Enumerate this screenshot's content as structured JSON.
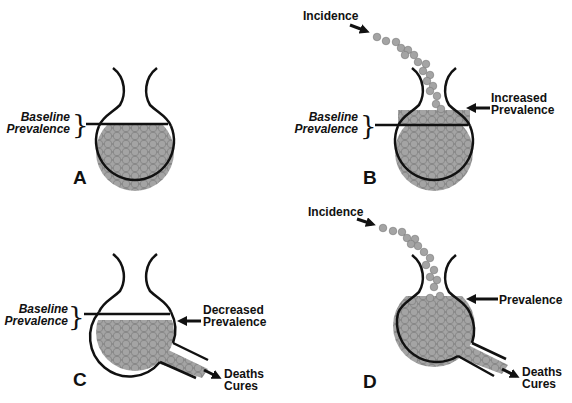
{
  "colors": {
    "ink": "#111111",
    "ball_fill": "#9a9a9a",
    "ball_stroke": "#6e6e6e",
    "background": "#ffffff"
  },
  "panels": [
    {
      "id": "A",
      "letter": "A",
      "baseline_label": [
        "Baseline",
        "Prevalence"
      ]
    },
    {
      "id": "B",
      "letter": "B",
      "baseline_label": [
        "Baseline",
        "Prevalence"
      ],
      "incidence_label": "Incidence",
      "prevalence_label": [
        "Increased",
        "Prevalence"
      ]
    },
    {
      "id": "C",
      "letter": "C",
      "baseline_label": [
        "Baseline",
        "Prevalence"
      ],
      "prevalence_label": [
        "Decreased",
        "Prevalence"
      ],
      "outflow_label": [
        "Deaths",
        "Cures"
      ]
    },
    {
      "id": "D",
      "letter": "D",
      "incidence_label": "Incidence",
      "prevalence_label": [
        "Prevalence"
      ],
      "outflow_label": [
        "Deaths",
        "Cures"
      ]
    }
  ]
}
